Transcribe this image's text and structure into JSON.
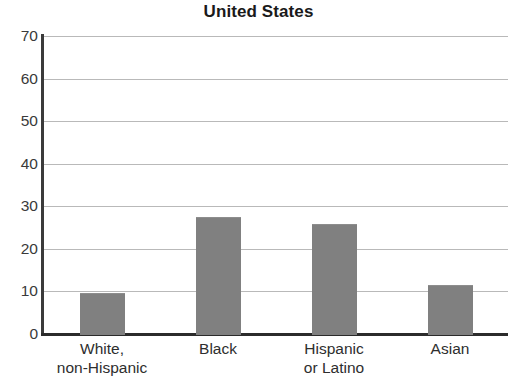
{
  "chart_data": {
    "type": "bar",
    "title": "United States",
    "xlabel": "",
    "ylabel": "",
    "categories": [
      "White,\nnon-Hispanic",
      "Black",
      "Hispanic\nor Latino",
      "Asian"
    ],
    "category_labels_flat": [
      "White, non-Hispanic",
      "Black",
      "Hispanic or Latino",
      "Asian"
    ],
    "values": [
      9.7,
      27.4,
      25.8,
      11.5
    ],
    "ylim": [
      0,
      70
    ],
    "ytick_values": [
      0,
      10,
      20,
      30,
      40,
      50,
      60,
      70
    ],
    "ytick_labels": [
      "0",
      "10",
      "20",
      "30",
      "40",
      "50",
      "60",
      "70"
    ],
    "grid": true,
    "grid_axis": "y",
    "legend": false,
    "legend_position": "none",
    "bar_color": "#808080",
    "gridline_color": "#b9b9b9",
    "axis_color": "#2b2b2b",
    "background_color": "#ffffff",
    "text_color": "#231f20"
  }
}
